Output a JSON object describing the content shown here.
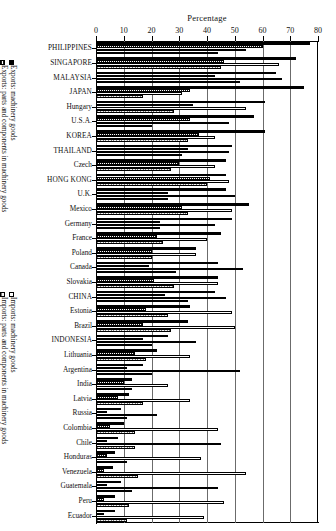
{
  "chart_data": {
    "type": "bar",
    "orientation": "horizontal",
    "title": "",
    "xlabel": "Percentage",
    "ylabel": "",
    "xlim": [
      0,
      80
    ],
    "xticks": [
      0,
      10,
      20,
      30,
      40,
      50,
      60,
      70,
      80
    ],
    "grid": true,
    "grid_axis": "x",
    "legend_position": "left-outside",
    "series": [
      {
        "name": "Exports: machinery goods",
        "key": "exp_mach",
        "style": "solid-black"
      },
      {
        "name": "Exports: parts and components in machinery goods",
        "key": "exp_parts",
        "style": "dark-hatch"
      },
      {
        "name": "Imports: machinery goods",
        "key": "imp_mach",
        "style": "white-outline"
      },
      {
        "name": "Imports: parts and components in machinery goods",
        "key": "imp_parts",
        "style": "light-stipple"
      }
    ],
    "categories": [
      "PHILIPPINES",
      "SINGAPORE",
      "MALAYSIA",
      "JAPAN",
      "Hungary",
      "U.S.A.",
      "KOREA",
      "THAILAND",
      "Czech",
      "HONG KONG",
      "U.K.",
      "Mexico",
      "Germany",
      "France",
      "Poland",
      "Canada",
      "Slovakia",
      "CHINA",
      "Estonia",
      "Brazil",
      "INDONESIA",
      "Lithuania",
      "Argentina",
      "India",
      "Latvia",
      "Russia",
      "Colombia",
      "Chile",
      "Honduras",
      "Venezuela",
      "Guatemala",
      "Peru",
      "Ecuador"
    ],
    "values": {
      "exp_mach": [
        77,
        72,
        65,
        75,
        61,
        57,
        61,
        49,
        47,
        47,
        47,
        55,
        49,
        45,
        36,
        44,
        44,
        43,
        34,
        33,
        26,
        22,
        17,
        13,
        12,
        9,
        10,
        8,
        7,
        6,
        9,
        7,
        7
      ],
      "exp_parts": [
        60,
        46,
        43,
        34,
        35,
        34,
        37,
        33,
        30,
        41,
        26,
        31,
        23,
        22,
        20,
        19,
        21,
        25,
        18,
        17,
        17,
        14,
        11,
        10,
        8,
        4,
        5,
        4,
        4,
        3,
        4,
        3,
        3
      ],
      "imp_mach": [
        54,
        66,
        67,
        31,
        54,
        48,
        43,
        48,
        43,
        48,
        50,
        49,
        43,
        40,
        36,
        53,
        44,
        47,
        49,
        50,
        36,
        34,
        52,
        26,
        34,
        22,
        44,
        45,
        38,
        54,
        44,
        46,
        39
      ],
      "imp_parts": [
        44,
        45,
        52,
        17,
        28,
        20,
        33,
        31,
        27,
        40,
        26,
        33,
        23,
        24,
        20,
        29,
        28,
        33,
        26,
        27,
        20,
        18,
        20,
        13,
        17,
        11,
        14,
        14,
        11,
        15,
        13,
        12,
        11
      ]
    }
  },
  "axis": {
    "title": "Percentage",
    "ticks": [
      "0",
      "10",
      "20",
      "30",
      "40",
      "50",
      "60",
      "70",
      "80"
    ]
  },
  "legend_exports": {
    "machinery": "Exports: machinery goods",
    "parts": "Exports: parts and components in machinery goods"
  },
  "legend_imports": {
    "machinery": "Imports: machinery goods",
    "parts": "Imports: parts and components in machinery goods"
  }
}
